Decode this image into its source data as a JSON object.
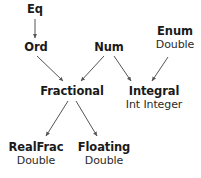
{
  "diagram": {
    "background_color": "#ffffff",
    "text_color": "#1a1a1a",
    "edge_color": "#555555",
    "nodes": [
      {
        "id": "eq",
        "class_name": "Eq",
        "instances": "",
        "x": 35,
        "y": 3
      },
      {
        "id": "ord",
        "class_name": "Ord",
        "instances": "",
        "x": 36,
        "y": 41
      },
      {
        "id": "num",
        "class_name": "Num",
        "instances": "",
        "x": 109,
        "y": 41
      },
      {
        "id": "enum",
        "class_name": "Enum",
        "instances": "Double",
        "x": 175,
        "y": 25
      },
      {
        "id": "fractional",
        "class_name": "Fractional",
        "instances": "",
        "x": 72,
        "y": 85
      },
      {
        "id": "integral",
        "class_name": "Integral",
        "instances": "Int Integer",
        "x": 154,
        "y": 85
      },
      {
        "id": "realfrac",
        "class_name": "RealFrac",
        "instances": "Double",
        "x": 36,
        "y": 141
      },
      {
        "id": "floating",
        "class_name": "Floating",
        "instances": "Double",
        "x": 104,
        "y": 141
      }
    ],
    "edges": [
      {
        "id": "eq-ord",
        "from": "eq",
        "to": "ord",
        "x1": 35,
        "y1": 19,
        "x2": 35,
        "y2": 38
      },
      {
        "id": "ord-fractional",
        "from": "ord",
        "to": "fractional",
        "x1": 37,
        "y1": 56,
        "x2": 63,
        "y2": 81
      },
      {
        "id": "num-fractional",
        "from": "num",
        "to": "fractional",
        "x1": 104,
        "y1": 56,
        "x2": 81,
        "y2": 81
      },
      {
        "id": "num-integral",
        "from": "num",
        "to": "integral",
        "x1": 114,
        "y1": 56,
        "x2": 131,
        "y2": 81
      },
      {
        "id": "enum-integral",
        "from": "enum",
        "to": "integral",
        "x1": 168,
        "y1": 57,
        "x2": 152,
        "y2": 81
      },
      {
        "id": "fractional-realfrac",
        "from": "fractional",
        "to": "realfrac",
        "x1": 68,
        "y1": 101,
        "x2": 46,
        "y2": 136
      },
      {
        "id": "fractional-floating",
        "from": "fractional",
        "to": "floating",
        "x1": 76,
        "y1": 101,
        "x2": 97,
        "y2": 136
      }
    ]
  }
}
